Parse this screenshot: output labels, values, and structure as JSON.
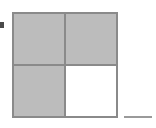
{
  "figure": {
    "canvas": {
      "width": 156,
      "height": 128,
      "background_color": "#ffffff"
    },
    "grid": {
      "rows": 2,
      "columns": 2,
      "total_parts": 4,
      "shaded_parts": 3,
      "unshaded_parts": 1,
      "fraction_shaded": "3/4",
      "outline_color": "#8a8a8a",
      "divider_color": "#8a8a8a",
      "shaded_color": "#bcbcbc",
      "unshaded_color": "#ffffff",
      "quadrants": [
        {
          "position": "top-left",
          "state": "shaded",
          "fill": "#bcbcbc"
        },
        {
          "position": "top-right",
          "state": "shaded",
          "fill": "#bcbcbc"
        },
        {
          "position": "bottom-left",
          "state": "shaded",
          "fill": "#bcbcbc"
        },
        {
          "position": "bottom-right",
          "state": "unshaded",
          "fill": "#ffffff"
        }
      ]
    },
    "marker": {
      "name": "bullet",
      "color": "#4a4a4a",
      "x": 0,
      "y": 22,
      "width": 4,
      "height": 6
    },
    "rule": {
      "name": "baseline-rule",
      "color": "#9a9a9a",
      "x": 124,
      "y": 116,
      "width": 28,
      "height": 2
    },
    "labels": {
      "caption": "",
      "legend": ""
    }
  }
}
